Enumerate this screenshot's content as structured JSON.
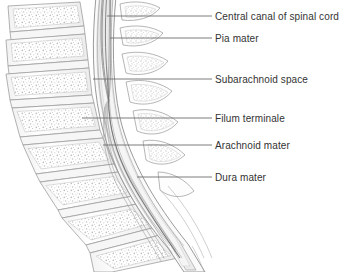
{
  "figure": {
    "background_color": "#ffffff",
    "width": 346,
    "height": 272
  },
  "palette": {
    "leader_line": "#6e6e6e",
    "label_text": "#333333",
    "bone_outline": "#9a9a9a",
    "bone_fill": "#fbfbfb",
    "trabecular_stipple": "#b8b8b8",
    "disc_fill": "#f4f4f4",
    "dura_line": "#8c8c8c",
    "arachnoid_line": "#a2a2a2",
    "csf_fill": "#f2f2f2",
    "cord_fill": "#e6e6e6",
    "cord_line": "#8e8e8e",
    "filum_line": "#9c9c9c"
  },
  "callouts": [
    {
      "id": "central-canal",
      "label": "Central canal of spinal cord",
      "text_x": 215,
      "text_y": 11,
      "leader": {
        "x1": 107,
        "y1": 16,
        "x2": 212,
        "y2": 16
      }
    },
    {
      "id": "pia-mater",
      "label": "Pia mater",
      "text_x": 215,
      "text_y": 33,
      "leader": {
        "x1": 110,
        "y1": 38,
        "x2": 212,
        "y2": 38
      }
    },
    {
      "id": "subarachnoid-space",
      "label": "Subarachnoid space",
      "text_x": 215,
      "text_y": 74,
      "leader": {
        "x1": 93,
        "y1": 79,
        "x2": 212,
        "y2": 79
      }
    },
    {
      "id": "filum-terminale",
      "label": "Filum terminale",
      "text_x": 215,
      "text_y": 113,
      "leader": {
        "x1": 82,
        "y1": 118,
        "x2": 212,
        "y2": 118
      }
    },
    {
      "id": "arachnoid-mater",
      "label": "Arachnoid mater",
      "text_x": 215,
      "text_y": 140,
      "leader": {
        "x1": 103,
        "y1": 145,
        "x2": 212,
        "y2": 145
      }
    },
    {
      "id": "dura-mater",
      "label": "Dura mater",
      "text_x": 215,
      "text_y": 172,
      "leader": {
        "x1": 137,
        "y1": 177,
        "x2": 212,
        "y2": 177
      }
    }
  ],
  "anatomy": {
    "vertebral_bodies": [
      {
        "id": "vertebra-1",
        "cx": 44,
        "cy": 22,
        "w": 74,
        "h": 26,
        "rot": -8
      },
      {
        "id": "vertebra-2",
        "cx": 44,
        "cy": 56,
        "w": 76,
        "h": 27,
        "rot": -4
      },
      {
        "id": "vertebra-3",
        "cx": 46,
        "cy": 92,
        "w": 78,
        "h": 28,
        "rot": 2
      },
      {
        "id": "vertebra-4",
        "cx": 52,
        "cy": 128,
        "w": 78,
        "h": 28,
        "rot": 10
      },
      {
        "id": "vertebra-5",
        "cx": 62,
        "cy": 163,
        "w": 76,
        "h": 28,
        "rot": 20
      },
      {
        "id": "vertebra-6",
        "cx": 80,
        "cy": 196,
        "w": 72,
        "h": 27,
        "rot": 32
      },
      {
        "id": "vertebra-7",
        "cx": 104,
        "cy": 224,
        "w": 64,
        "h": 25,
        "rot": 44
      },
      {
        "id": "vertebra-8",
        "cx": 130,
        "cy": 246,
        "w": 54,
        "h": 22,
        "rot": 54
      }
    ],
    "spinous_processes": [
      {
        "id": "spinous-1",
        "y": 22
      },
      {
        "id": "spinous-2",
        "y": 56
      },
      {
        "id": "spinous-3",
        "y": 92
      },
      {
        "id": "spinous-4",
        "y": 128
      },
      {
        "id": "spinous-5",
        "y": 163
      }
    ],
    "structures": [
      {
        "id": "dura-mater-sac",
        "name": "dura mater"
      },
      {
        "id": "arachnoid-mater-layer",
        "name": "arachnoid mater"
      },
      {
        "id": "subarachnoid-space-region",
        "name": "subarachnoid space"
      },
      {
        "id": "pia-mater-layer",
        "name": "pia mater"
      },
      {
        "id": "spinal-cord-body",
        "name": "spinal cord"
      },
      {
        "id": "central-canal-line",
        "name": "central canal of spinal cord"
      },
      {
        "id": "filum-terminale-strand",
        "name": "filum terminale"
      },
      {
        "id": "cauda-equina-fibers",
        "name": "cauda equina"
      }
    ]
  }
}
